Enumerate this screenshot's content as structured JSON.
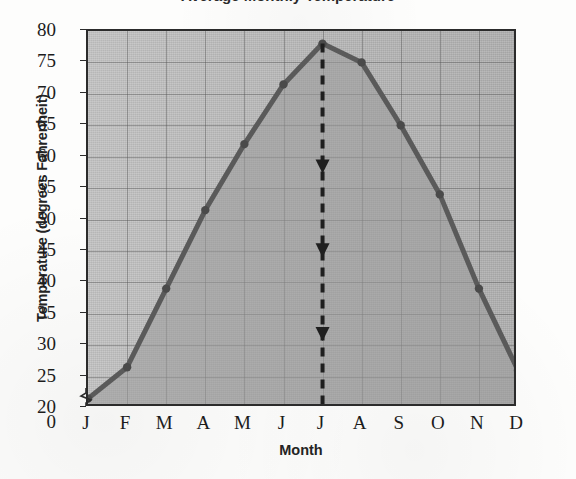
{
  "title_fragment": "Average Monthly Temperature",
  "axes": {
    "y_title": "Temperature (degrees Fahrenheit)",
    "x_title": "Month",
    "y_ticks": [
      "0",
      "20",
      "25",
      "30",
      "35",
      "40",
      "45",
      "50",
      "55",
      "60",
      "65",
      "70",
      "75",
      "80"
    ],
    "x_ticks": [
      "J",
      "F",
      "M",
      "A",
      "M",
      "J",
      "J",
      "A",
      "S",
      "O",
      "N",
      "D"
    ]
  },
  "colors": {
    "line": "#5a5a5a",
    "marker": "#4a4a4a",
    "plot_fill_light": "#c3c3c3",
    "plot_fill_dark": "#9a9a9a",
    "axis": "#2b2b2b",
    "gridline": "#6f6f6f",
    "annotation": "#1f1f1f",
    "text": "#1c1c1c"
  },
  "annotation": {
    "name": "dashed-arrow-at-july",
    "month": "J",
    "arrow_count": 3,
    "style": "dashed vertical line with three downward arrowheads"
  },
  "chart_data": {
    "type": "line",
    "title": "Average Monthly Temperature",
    "xlabel": "Month",
    "ylabel": "Temperature (degrees Fahrenheit)",
    "categories": [
      "J",
      "F",
      "M",
      "A",
      "M",
      "J",
      "J",
      "A",
      "S",
      "O",
      "N",
      "D"
    ],
    "month_names": [
      "January",
      "February",
      "March",
      "April",
      "May",
      "June",
      "July",
      "August",
      "September",
      "October",
      "November",
      "December"
    ],
    "values": [
      21.5,
      26.5,
      39,
      51.5,
      62,
      71.5,
      78,
      75,
      65,
      54,
      39,
      26
    ],
    "ylim": [
      20,
      80
    ],
    "y_axis_break_below": 20,
    "ytick_step": 5,
    "grid": true,
    "legend": "none",
    "fill_under_curve": true,
    "marker": "circle"
  }
}
